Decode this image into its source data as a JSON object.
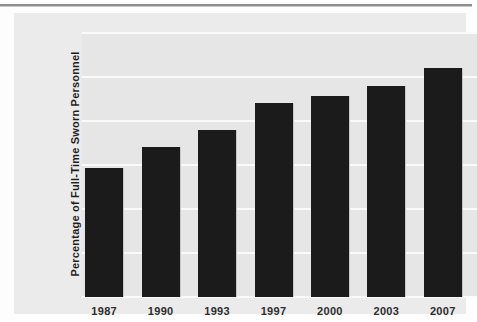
{
  "chart_data": {
    "type": "bar",
    "title": "",
    "xlabel": "",
    "ylabel": "Percentage of Full-Time Sworn Personnel",
    "categories": [
      "1987",
      "1990",
      "1993",
      "1997",
      "2000",
      "2003",
      "2007"
    ],
    "values": [
      14.7,
      17.0,
      19.0,
      22.0,
      22.8,
      24.0,
      26.0
    ],
    "ylim": [
      0,
      30
    ],
    "yticks": [
      0,
      5,
      10,
      15,
      20,
      25,
      30
    ],
    "ytick_labels": [
      "0",
      "5",
      "10",
      "15",
      "20",
      "25",
      "30"
    ],
    "grid": true,
    "legend": "none",
    "colors": {
      "bar": "#1b1b1b",
      "plot_background": "#e6e6e6",
      "panel_background": "#ebebeb",
      "gridline": "#fafafa",
      "tick_text": "#4d4d4d",
      "axis_title_text": "#1f1f1f"
    }
  }
}
